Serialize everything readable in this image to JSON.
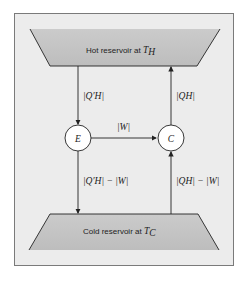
{
  "diagram": {
    "hot_reservoir": {
      "label": "Hot reservoir at ",
      "temp_symbol": "T",
      "temp_subscript": "H"
    },
    "cold_reservoir": {
      "label": "Cold reservoir at ",
      "temp_symbol": "T",
      "temp_subscript": "C"
    },
    "engine": {
      "label": "E"
    },
    "refrigerator": {
      "label": "C"
    },
    "arrows": {
      "hot_to_engine": {
        "label": "|Q′H|"
      },
      "engine_to_refrigerator": {
        "label": "|W|"
      },
      "refrigerator_to_hot": {
        "label": "|QH|"
      },
      "engine_to_cold": {
        "label": "|Q′H| − |W|"
      },
      "cold_to_refrigerator": {
        "label": "|QH| − |W|"
      }
    },
    "colors": {
      "panel": "#ececec",
      "reservoir": "#c6c6c6",
      "line": "#222222",
      "circle_fill": "#ffffff"
    }
  }
}
